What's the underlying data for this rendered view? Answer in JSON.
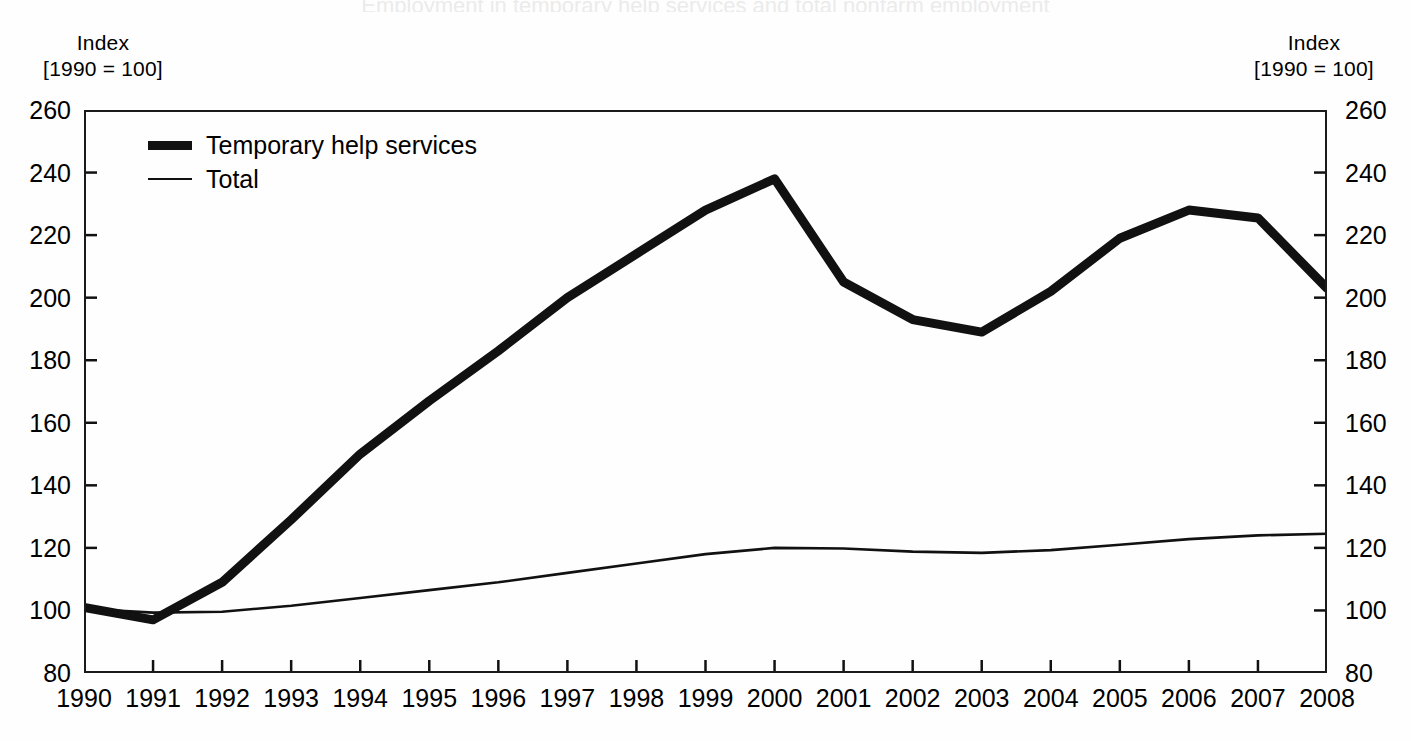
{
  "figure": {
    "background_color": "#fefefe",
    "ink_color": "#111111",
    "cropped_title": "Employment in temporary help services and total nonfarm employment"
  },
  "axes": {
    "left_unit_line1": "Index",
    "left_unit_line2": "[1990 = 100]",
    "right_unit_line1": "Index",
    "right_unit_line2": "[1990 = 100]"
  },
  "legend": {
    "entries": [
      {
        "label": "Temporary help services",
        "style": "thick"
      },
      {
        "label": "Total",
        "style": "thin"
      }
    ]
  },
  "chart_data": {
    "type": "line",
    "title": "",
    "xlabel": "",
    "ylabel": "Index [1990 = 100]",
    "xlim": [
      1990,
      2008
    ],
    "ylim": [
      80,
      260
    ],
    "yticks": [
      80,
      100,
      120,
      140,
      160,
      180,
      200,
      220,
      240,
      260
    ],
    "xticks": [
      1990,
      1991,
      1992,
      1993,
      1994,
      1995,
      1996,
      1997,
      1998,
      1999,
      2000,
      2001,
      2002,
      2003,
      2004,
      2005,
      2006,
      2007,
      2008
    ],
    "x": [
      1990,
      1991,
      1992,
      1993,
      1994,
      1995,
      1996,
      1997,
      1998,
      1999,
      2000,
      2001,
      2002,
      2003,
      2004,
      2005,
      2006,
      2007,
      2008
    ],
    "grid": false,
    "legend_position": "upper left",
    "dual_axis": true,
    "series": [
      {
        "name": "Temporary help services",
        "style": "thick",
        "color": "#111111",
        "values": [
          101,
          97,
          109,
          129,
          150,
          167,
          183,
          200,
          214,
          228,
          238,
          205,
          193,
          189,
          202,
          219,
          228,
          225.5,
          203
        ]
      },
      {
        "name": "Total",
        "style": "thin",
        "color": "#111111",
        "values": [
          100.5,
          99.3,
          99.6,
          101.5,
          104,
          106.5,
          109,
          112,
          115,
          118,
          120,
          119.8,
          118.8,
          118.4,
          119.3,
          121,
          122.8,
          124,
          124.5
        ]
      }
    ]
  }
}
